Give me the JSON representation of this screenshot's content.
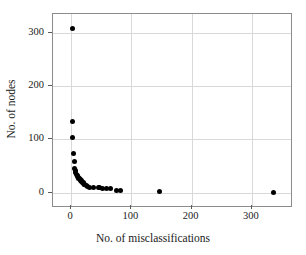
{
  "chart_data": {
    "type": "scatter",
    "title": "",
    "xlabel": "No. of misclassifications",
    "ylabel": "No. of nodes",
    "xlim": [
      -30,
      365
    ],
    "ylim": [
      -25,
      335
    ],
    "xticks": [
      0,
      100,
      200,
      300
    ],
    "yticks": [
      0,
      100,
      200,
      300
    ],
    "grid": true,
    "legend": null,
    "marker": {
      "shape": "circle",
      "color": "#000000",
      "size_px": 5
    },
    "series": [
      {
        "name": "tree complexity",
        "x": [
          2,
          2,
          3,
          4,
          5,
          6,
          7,
          8,
          9,
          10,
          11,
          12,
          13,
          14,
          15,
          16,
          17,
          18,
          19,
          20,
          21,
          22,
          23,
          25,
          27,
          31,
          38,
          45,
          48,
          52,
          58,
          66,
          75,
          82,
          147,
          336
        ],
        "y": [
          308,
          133,
          104,
          73,
          59,
          45,
          41,
          38,
          35,
          33,
          31,
          29,
          27,
          26,
          24,
          23,
          22,
          21,
          20,
          19,
          18,
          16,
          15,
          13,
          12,
          10,
          10,
          9,
          9,
          8,
          8,
          7,
          5,
          4,
          2,
          0
        ]
      }
    ]
  },
  "axes": {
    "xtick_labels": [
      "0",
      "100",
      "200",
      "300"
    ],
    "ytick_labels": [
      "0",
      "100",
      "200",
      "300"
    ]
  }
}
